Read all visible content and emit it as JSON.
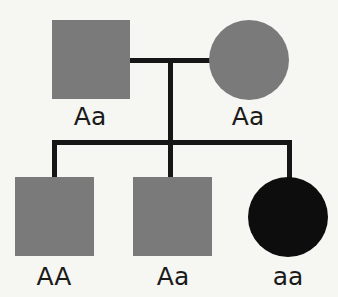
{
  "pedigree": {
    "colors": {
      "carrier": "#7a7a7a",
      "affected": "#0d0d0d",
      "lines": "#161616",
      "background": "#f6f6f3"
    },
    "generation_1": {
      "father": {
        "sex": "male",
        "shape": "square",
        "status": "carrier",
        "genotype": "Aa"
      },
      "mother": {
        "sex": "female",
        "shape": "circle",
        "status": "carrier",
        "genotype": "Aa"
      }
    },
    "generation_2": [
      {
        "sex": "male",
        "shape": "square",
        "status": "shaded",
        "genotype": "AA"
      },
      {
        "sex": "male",
        "shape": "square",
        "status": "shaded",
        "genotype": "Aa"
      },
      {
        "sex": "female",
        "shape": "circle",
        "status": "affected",
        "genotype": "aa"
      }
    ]
  }
}
